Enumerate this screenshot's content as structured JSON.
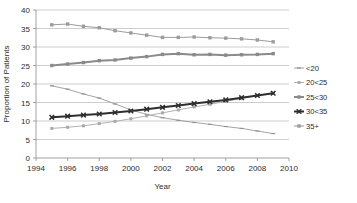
{
  "chart_data": {
    "type": "line",
    "title": "",
    "xlabel": "Year",
    "ylabel": "Proportion of Patients",
    "xlim": [
      1994,
      2010
    ],
    "ylim": [
      0,
      40
    ],
    "xticks": [
      1994,
      1996,
      1998,
      2000,
      2002,
      2004,
      2006,
      2008,
      2010
    ],
    "yticks": [
      0,
      5,
      10,
      15,
      20,
      25,
      30,
      35,
      40
    ],
    "grid": "horizontal",
    "legend_position": "right",
    "x": [
      1995,
      1996,
      1997,
      1998,
      1999,
      2000,
      2001,
      2002,
      2003,
      2004,
      2005,
      2006,
      2007,
      2008,
      2009
    ],
    "series": [
      {
        "name": "<20",
        "color": "#8d8d8d",
        "marker": "tick",
        "line_width": 0.8,
        "values": [
          19.5,
          18.6,
          17.3,
          16.2,
          14.6,
          13.0,
          11.8,
          10.9,
          10.2,
          9.6,
          9.1,
          8.5,
          8.0,
          7.3,
          6.6
        ]
      },
      {
        "name": "20<25",
        "color": "#a9a9a9",
        "marker": "square-small",
        "line_width": 0.9,
        "values": [
          8.0,
          8.3,
          8.7,
          9.3,
          9.9,
          10.6,
          11.4,
          12.2,
          13.0,
          13.8,
          14.5,
          15.3,
          16.1,
          16.9,
          17.6
        ]
      },
      {
        "name": "25<30",
        "color": "#8a8a8a",
        "marker": "square",
        "line_width": 2.0,
        "values": [
          25.0,
          25.4,
          25.8,
          26.3,
          26.5,
          27.0,
          27.4,
          28.0,
          28.2,
          27.9,
          28.0,
          27.8,
          27.9,
          28.0,
          28.2
        ]
      },
      {
        "name": "30<35",
        "color": "#2e2e2e",
        "marker": "x",
        "line_width": 2.0,
        "values": [
          11.0,
          11.3,
          11.6,
          11.9,
          12.3,
          12.7,
          13.2,
          13.7,
          14.2,
          14.7,
          15.2,
          15.7,
          16.3,
          16.9,
          17.5
        ]
      },
      {
        "name": "35+",
        "color": "#9b9b9b",
        "marker": "square",
        "line_width": 1.0,
        "values": [
          36.0,
          36.2,
          35.6,
          35.2,
          34.4,
          33.8,
          33.2,
          32.6,
          32.6,
          32.7,
          32.5,
          32.4,
          32.2,
          31.9,
          31.4
        ]
      }
    ]
  },
  "legend": {
    "entries": [
      {
        "label": "<20"
      },
      {
        "label": "20<25"
      },
      {
        "label": "25<30"
      },
      {
        "label": "30<35"
      },
      {
        "label": "35+"
      }
    ]
  }
}
